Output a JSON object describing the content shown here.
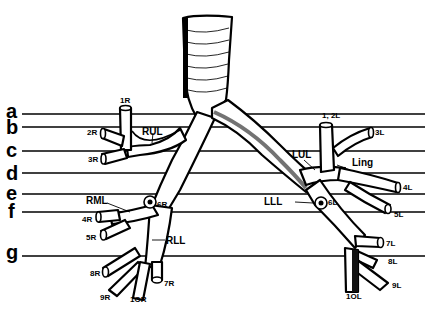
{
  "diagram": {
    "levels": [
      {
        "label": "a",
        "y": 114
      },
      {
        "label": "b",
        "y": 127
      },
      {
        "label": "c",
        "y": 151
      },
      {
        "label": "d",
        "y": 173
      },
      {
        "label": "e",
        "y": 194
      },
      {
        "label": "f",
        "y": 212
      },
      {
        "label": "g",
        "y": 256
      }
    ],
    "lobes": {
      "rul": "RUL",
      "rml": "RML",
      "rll": "RLL",
      "lul": "LUL",
      "ling": "Ling",
      "lll": "LLL"
    },
    "segments_right": {
      "s1": "1R",
      "s2": "2R",
      "s3": "3R",
      "s4": "4R",
      "s5": "5R",
      "s6": "6R",
      "s7": "7R",
      "s8": "8R",
      "s9": "9R",
      "s10": "1OR"
    },
    "segments_left": {
      "s12": "1, 2L",
      "s3": "3L",
      "s4": "4L",
      "s5": "5L",
      "s6": "6L",
      "s7": "7L",
      "s8": "8L",
      "s9": "9L",
      "s10": "1OL"
    }
  }
}
